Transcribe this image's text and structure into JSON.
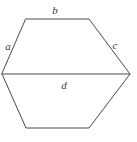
{
  "figure": {
    "name": "hexagon-with-labeled-sides",
    "shape": "hexagon",
    "background_color": "#ffffff",
    "stroke_color": "#4a4a4a",
    "label_color": "#3a3a3a",
    "vertices": [
      {
        "name": "top-left",
        "x": 26,
        "y": 19
      },
      {
        "name": "top-right",
        "x": 89,
        "y": 19
      },
      {
        "name": "right",
        "x": 130,
        "y": 74
      },
      {
        "name": "bottom-right",
        "x": 89,
        "y": 128
      },
      {
        "name": "bottom-left",
        "x": 26,
        "y": 128
      },
      {
        "name": "left",
        "x": 2,
        "y": 74
      }
    ],
    "outline_path": "M 26 19 L 89 19 L 130 74 L 89 128 L 26 128 L 2 74 Z",
    "diagonal_path": "M 2 74 L 130 74",
    "labels": [
      {
        "id": "a",
        "text": "a",
        "x": 8,
        "y": 46,
        "edge": "left-upper"
      },
      {
        "id": "b",
        "text": "b",
        "x": 55,
        "y": 10,
        "edge": "top"
      },
      {
        "id": "c",
        "text": "c",
        "x": 115,
        "y": 45,
        "edge": "right-upper"
      },
      {
        "id": "d",
        "text": "d",
        "x": 64,
        "y": 85,
        "edge": "diagonal"
      }
    ]
  }
}
